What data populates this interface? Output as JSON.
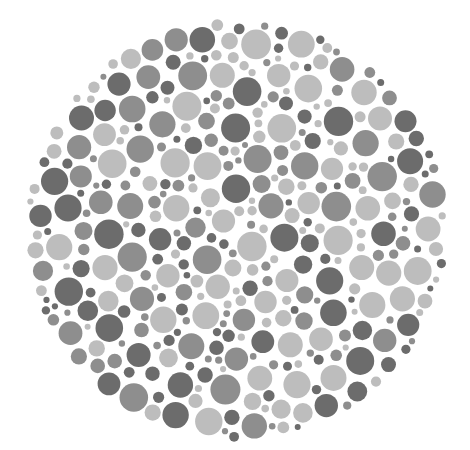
{
  "plate": {
    "type": "color-vision-test-plate",
    "rendering": "grayscale",
    "background": "#ffffff",
    "center": {
      "x": 237,
      "y": 230
    },
    "radius_x": 212,
    "radius_y": 212,
    "palette": {
      "dark": "#6c6c6c",
      "mid": "#8e8e8e",
      "light": "#bdbdbd"
    },
    "palette_weights": {
      "dark": 0.32,
      "mid": 0.3,
      "light": 0.38
    },
    "dot_sizes": {
      "min_radius": 3,
      "max_radius": 15
    },
    "seed": 20240611,
    "hidden_figure": "none visible"
  }
}
